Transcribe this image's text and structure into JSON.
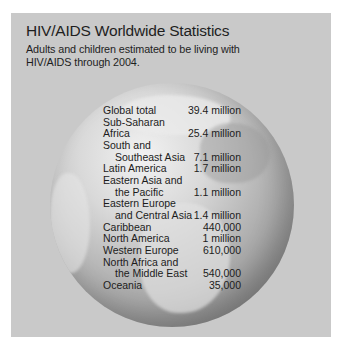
{
  "header": {
    "title": "HIV/AIDS Worldwide Statistics",
    "subtitle": "Adults and children estimated to be living with HIV/AIDS through 2004."
  },
  "stats": {
    "rows": [
      {
        "line1": "Global total",
        "line2": null,
        "value": "39.4 million"
      },
      {
        "line1": "Sub-Saharan Africa",
        "line2": null,
        "value": "25.4 million"
      },
      {
        "line1": "South and",
        "line2": "Southeast Asia",
        "value": "7.1 million"
      },
      {
        "line1": "Latin America",
        "line2": null,
        "value": "1.7 million"
      },
      {
        "line1": "Eastern Asia and",
        "line2": "the Pacific",
        "value": "1.1 million"
      },
      {
        "line1": "Eastern Europe",
        "line2": "and Central Asia",
        "value": "1.4 million"
      },
      {
        "line1": "Caribbean",
        "line2": null,
        "value": "440,000"
      },
      {
        "line1": "North America",
        "line2": null,
        "value": "1 million"
      },
      {
        "line1": "Western Europe",
        "line2": null,
        "value": "610,000"
      },
      {
        "line1": "North Africa and",
        "line2": "the Middle East",
        "value": "540,000"
      },
      {
        "line1": "Oceania",
        "line2": null,
        "value": "35,000"
      }
    ]
  },
  "graphic": {
    "icon": "globe-icon",
    "panel_color": "#c9c9c9"
  }
}
